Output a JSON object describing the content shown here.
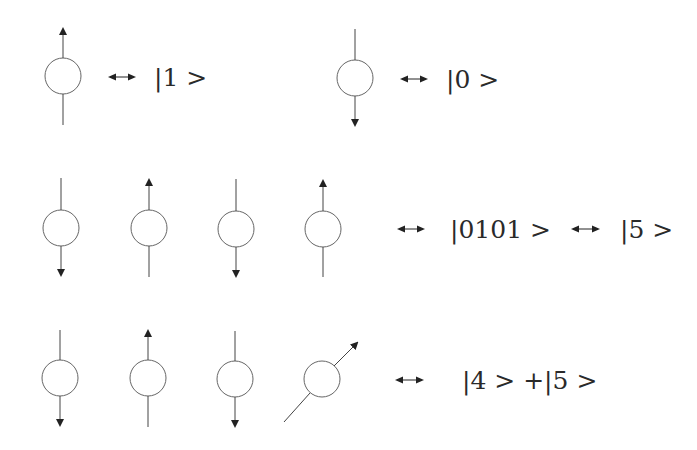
{
  "diagram": {
    "stroke_color": "#555555",
    "arrow_color": "#222222",
    "equivalence_symbol": "↔",
    "rows": [
      {
        "id": "single-qubits",
        "groups": [
          {
            "spins": [
              "up"
            ],
            "relations": [
              "|1 >"
            ]
          },
          {
            "spins": [
              "down"
            ],
            "relations": [
              "|0 >"
            ]
          }
        ]
      },
      {
        "id": "four-qubit-basis",
        "spins": [
          "down",
          "up",
          "down",
          "up"
        ],
        "relations": [
          "|0101 >",
          "|5 >"
        ]
      },
      {
        "id": "four-qubit-superposition",
        "spins": [
          "down",
          "up",
          "down",
          "diagonal"
        ],
        "relations": [
          "|4 > +|5 >"
        ]
      }
    ],
    "labels": {
      "ket_1": "|1 >",
      "ket_0": "|0 >",
      "ket_0101": "|0101 >",
      "ket_5": "|5 >",
      "ket_4_plus_5": "|4 > +|5 >",
      "equiv": "↔"
    }
  }
}
